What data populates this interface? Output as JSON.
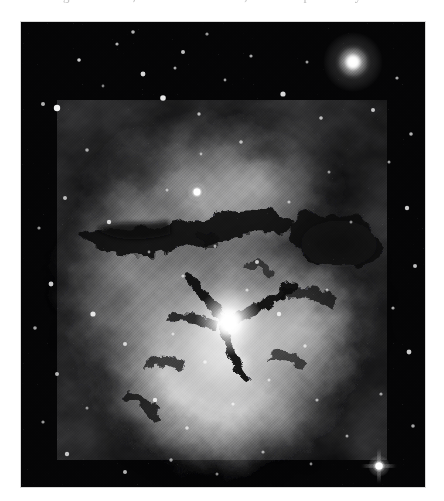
{
  "page": {
    "background_color": "#ffffff",
    "width": 444,
    "height": 501
  },
  "text_fragment": {
    "clipped_line": "sinking of the stars, the faintest of them, in the deep field beyond"
  },
  "figure": {
    "name": "trifid-nebula-plate",
    "kind": "astronomical-photograph",
    "rendering": "monochrome halftone print",
    "frame": {
      "x": 21,
      "y": 22,
      "width": 404,
      "height": 465
    },
    "border_color": "#d9d9d9",
    "sky_color": "#050506",
    "nebula_color": "#e8e8e8",
    "dust_lane_color": "#121214",
    "star_color": "#ffffff",
    "features": [
      {
        "name": "bright-field-star-upper-right",
        "cx": 0.82,
        "cy": 0.085,
        "radius": 0.055,
        "brightness": 1.0
      },
      {
        "name": "bright-field-star-lower-right",
        "cx": 0.885,
        "cy": 0.955,
        "radius": 0.02,
        "brightness": 0.95
      },
      {
        "name": "central-illuminating-star",
        "cx": 0.515,
        "cy": 0.645,
        "radius": 0.03,
        "brightness": 1.0
      },
      {
        "name": "upper-lobe-star",
        "cx": 0.435,
        "cy": 0.365,
        "radius": 0.022,
        "brightness": 0.92
      },
      {
        "name": "dark-lane-north",
        "description": "dust lane running east-west across upper nebula"
      },
      {
        "name": "dark-lane-northeast",
        "description": "broad dust bay on right flank of nebula"
      },
      {
        "name": "dark-lane-trifid-junction",
        "description": "three-way rift dividing the bright southern lobe"
      },
      {
        "name": "southern-bright-lobe",
        "description": "rounded high-surface-brightness emission region"
      },
      {
        "name": "northern-diffuse-lobe",
        "description": "fainter mottled nebulosity above the dust lanes"
      }
    ]
  }
}
